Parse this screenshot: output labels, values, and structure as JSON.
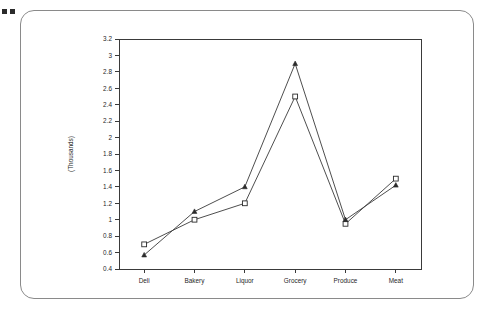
{
  "panel": {
    "corner_marks": [
      "mark-1",
      "mark-2"
    ]
  },
  "chart_data": {
    "type": "line",
    "title": "",
    "subtitle": "",
    "xlabel": "",
    "ylabel": "(Thousands)",
    "categories": [
      "Deli",
      "Bakery",
      "Liquor",
      "Grocery",
      "Produce",
      "Meat"
    ],
    "series": [
      {
        "name": "series-square",
        "marker": "open-square",
        "values": [
          0.7,
          1.0,
          1.2,
          2.5,
          0.95,
          1.5
        ]
      },
      {
        "name": "series-triangle",
        "marker": "filled-triangle",
        "values": [
          0.57,
          1.1,
          1.4,
          2.9,
          1.0,
          1.42
        ]
      }
    ],
    "ylim": [
      0.4,
      3.2
    ],
    "ytick_step": 0.2,
    "ytick_labels": [
      "3.2",
      "3",
      "2.8",
      "2.6",
      "2.4",
      "2.2",
      "2",
      "1.8",
      "1.6",
      "1.4",
      "1.2",
      "1",
      "0.8",
      "0.6",
      "0.4"
    ],
    "ytick_values": [
      3.2,
      3.0,
      2.8,
      2.6,
      2.4,
      2.2,
      2.0,
      1.8,
      1.6,
      1.4,
      1.2,
      1.0,
      0.8,
      0.6,
      0.4
    ],
    "grid": false,
    "legend": "none",
    "legend_position": "none",
    "line_color": "#3a3a3a",
    "plot_border_color": "#3a3a3a",
    "background_color": "#ffffff"
  }
}
